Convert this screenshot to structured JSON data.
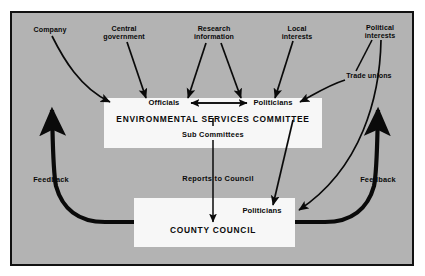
{
  "diagram": {
    "background_color": "#b3b3b3",
    "box_color": "#f7f7f7",
    "line_color": "#0a0a0a",
    "frame_border_color": "#111111"
  },
  "sources": [
    {
      "id": "company",
      "label": "Company",
      "x": 50,
      "y": 27
    },
    {
      "id": "central-government",
      "label": "Central\ngovernment",
      "x": 124,
      "y": 26
    },
    {
      "id": "research-information",
      "label": "Research\ninformation",
      "x": 214,
      "y": 26
    },
    {
      "id": "local-interests",
      "label": "Local\ninterests",
      "x": 297,
      "y": 26
    },
    {
      "id": "political-interests",
      "label": "Political\ninterests",
      "x": 380,
      "y": 25
    },
    {
      "id": "trade-unions",
      "label": "Trade unions",
      "x": 369,
      "y": 77
    }
  ],
  "committee": {
    "officials_label": "Officials",
    "politicians_label": "Politicians",
    "title": "ENVIRONMENTAL SERVICES COMMITTEE",
    "sub_committees_label": "Sub Committees"
  },
  "council": {
    "politicians_label": "Politicians",
    "title": "COUNTY COUNCIL"
  },
  "flows": {
    "reports_to_council": "Reports to Council",
    "feedback_left": "Feedback",
    "feedback_right": "Feedback"
  }
}
